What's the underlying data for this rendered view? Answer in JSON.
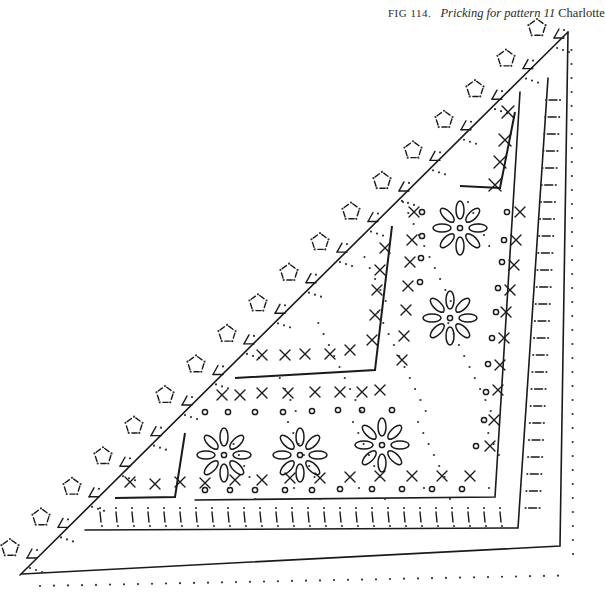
{
  "caption": {
    "figure_label": "FIG 114.",
    "title_italic": "Pricking for pattern 11",
    "title_name": "Charlotte"
  },
  "diagram": {
    "shape": "right-angled triangle corner",
    "ink_color": "#1a1a1a",
    "background_color": "#ffffff",
    "regions": [
      {
        "name": "scalloped-edge",
        "motif": "dashed pentagon-and-triangle picots",
        "count": 18
      },
      {
        "name": "outer-footside-rows",
        "motif": "pinholes with dashed bars"
      },
      {
        "name": "inner-triangle-left",
        "motif": "cross stitches (x)"
      },
      {
        "name": "inner-triangle-right",
        "motif": "cross stitches (x)"
      },
      {
        "name": "ground",
        "motif": "petal flowers, small rings, crosses"
      }
    ],
    "flowers": 5,
    "symbols": [
      "x",
      "o",
      "petal",
      "dash",
      "pinhole"
    ]
  }
}
